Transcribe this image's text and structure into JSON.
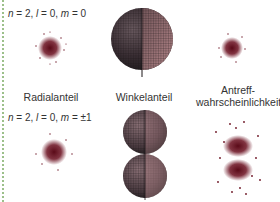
{
  "rows": [
    {
      "label": "n = 2, l = 0, m = 0",
      "label_parts": {
        "n": "n",
        "n_val": " = 2, ",
        "l": "l",
        "l_val": " = 0, ",
        "m": "m",
        "m_val": " = 0"
      }
    },
    {
      "label": "n = 2, l = 0, m = ±1",
      "label_parts": {
        "n": "n",
        "n_val": " = 2, ",
        "l": "l",
        "l_val": " = 0, ",
        "m": "m",
        "m_val": " = ±1"
      }
    }
  ],
  "columns": {
    "radial": "Radialanteil",
    "angular": "Winkelanteil",
    "probability_line1": "Antreff-",
    "probability_line2": "wahrscheinlichkeit"
  },
  "colors": {
    "dots": "#6b1020",
    "border": "#9cc08a",
    "sphere_dark": "#2a2226",
    "sphere_light": "#b9868a"
  }
}
